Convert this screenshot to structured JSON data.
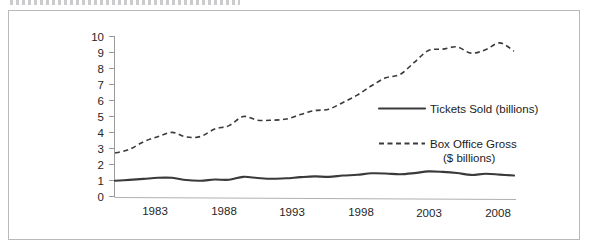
{
  "chart_data": {
    "type": "line",
    "title": "",
    "xlabel": "",
    "ylabel": "",
    "xlim": [
      1980,
      2008
    ],
    "ylim": [
      0,
      10
    ],
    "grid": false,
    "legend_position": "center-right-inside",
    "x_tick_labels": [
      "1983",
      "1988",
      "1993",
      "1998",
      "2003",
      "2008"
    ],
    "x_tick_values": [
      1983,
      1988,
      1993,
      1998,
      2003,
      2008
    ],
    "y_tick_labels": [
      "0",
      "1",
      "2",
      "3",
      "4",
      "5",
      "6",
      "7",
      "8",
      "9",
      "10"
    ],
    "y_tick_values": [
      0,
      1,
      2,
      3,
      4,
      5,
      6,
      7,
      8,
      9,
      10
    ],
    "x": [
      1980,
      1981,
      1982,
      1983,
      1984,
      1985,
      1986,
      1987,
      1988,
      1989,
      1990,
      1991,
      1992,
      1993,
      1994,
      1995,
      1996,
      1997,
      1998,
      1999,
      2000,
      2001,
      2002,
      2003,
      2004,
      2005,
      2006,
      2007,
      2008
    ],
    "series": [
      {
        "name": "Tickets Sold (billions)",
        "style": "solid",
        "color": "#3a3a3a",
        "values": [
          1.02,
          1.07,
          1.13,
          1.2,
          1.2,
          1.06,
          1.02,
          1.09,
          1.08,
          1.26,
          1.19,
          1.14,
          1.17,
          1.24,
          1.29,
          1.26,
          1.34,
          1.39,
          1.48,
          1.47,
          1.42,
          1.49,
          1.6,
          1.57,
          1.5,
          1.38,
          1.45,
          1.4,
          1.34
        ]
      },
      {
        "name": "Box Office Gross ($ billions)",
        "style": "dashed",
        "color": "#3a3a3a",
        "values": [
          2.75,
          2.97,
          3.45,
          3.77,
          4.04,
          3.75,
          3.78,
          4.25,
          4.46,
          5.03,
          4.8,
          4.8,
          4.87,
          5.15,
          5.4,
          5.49,
          5.91,
          6.37,
          6.95,
          7.45,
          7.66,
          8.41,
          9.16,
          9.24,
          9.38,
          8.99,
          9.2,
          9.63,
          9.11
        ]
      }
    ],
    "legend_entries": [
      {
        "label": "Tickets Sold (billions)",
        "style": "solid"
      },
      {
        "label": "Box Office Gross",
        "label2": "($ billions)",
        "style": "dashed"
      }
    ]
  },
  "legend": {
    "tickets_label": "Tickets Sold (billions)",
    "box_office_label_line1": "Box Office Gross",
    "box_office_label_line2": "($ billions)"
  },
  "axes": {
    "y_labels": [
      "10",
      "9",
      "8",
      "7",
      "6",
      "5",
      "4",
      "3",
      "2",
      "1",
      "0"
    ],
    "x_labels": [
      "1983",
      "1988",
      "1993",
      "1998",
      "2003",
      "2008"
    ]
  }
}
